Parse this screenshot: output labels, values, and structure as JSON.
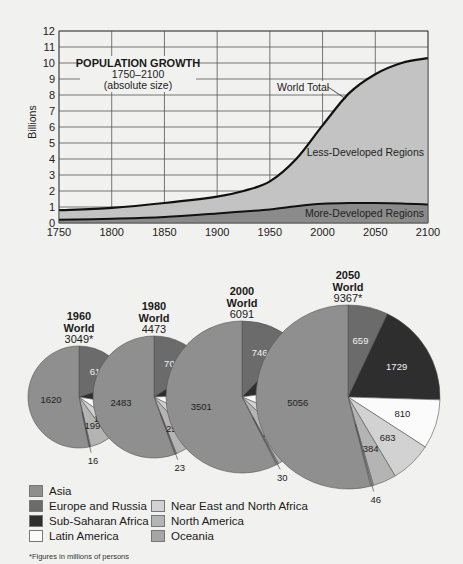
{
  "chart_data": [
    {
      "type": "area",
      "title": "POPULATION GROWTH",
      "subtitle": "1750–2100",
      "subtitle2": "(absolute size)",
      "xlabel": "",
      "ylabel": "Billions",
      "xlim": [
        1750,
        2100
      ],
      "ylim": [
        0,
        12
      ],
      "grid": true,
      "x_ticks": [
        "1750",
        "1800",
        "1850",
        "1900",
        "1950",
        "2000",
        "2050",
        "2100"
      ],
      "y_ticks": [
        "0",
        "1",
        "2",
        "3",
        "4",
        "5",
        "6",
        "7",
        "8",
        "9",
        "10",
        "11",
        "12"
      ],
      "x": [
        1750,
        1800,
        1850,
        1900,
        1925,
        1950,
        1975,
        2000,
        2025,
        2050,
        2075,
        2100
      ],
      "series": [
        {
          "name": "World Total",
          "values": [
            0.8,
            0.95,
            1.25,
            1.65,
            2.0,
            2.6,
            4.0,
            6.1,
            8.1,
            9.3,
            10.0,
            10.3
          ]
        },
        {
          "name": "More-Developed Regions",
          "values": [
            0.2,
            0.27,
            0.38,
            0.6,
            0.72,
            0.85,
            1.05,
            1.2,
            1.25,
            1.25,
            1.22,
            1.15
          ]
        }
      ],
      "annotations": [
        "World Total",
        "Less-Developed Regions",
        "More-Developed Regions"
      ]
    },
    {
      "type": "pie",
      "title": "World population by region",
      "note": "*Figures in millions of persons",
      "categories": [
        "Asia",
        "Europe and Russia",
        "Sub-Saharan Africa",
        "Latin America",
        "Near East and North Africa",
        "North America",
        "Oceania"
      ],
      "series": [
        {
          "name": "1960 World",
          "total": "3049*",
          "values": [
            1620,
            615,
            227,
            218,
            154,
            199,
            16
          ]
        },
        {
          "name": "1980 World",
          "total": "4473",
          "values": [
            2483,
            708,
            381,
            364,
            262,
            252,
            23
          ]
        },
        {
          "name": "2000 World",
          "total": "6091",
          "values": [
            3501,
            746,
            645,
            515,
            346,
            308,
            30
          ]
        },
        {
          "name": "2050 World",
          "total": "9367*",
          "values": [
            5056,
            659,
            1729,
            810,
            683,
            384,
            46
          ]
        }
      ]
    }
  ],
  "colors": {
    "Asia": "#8f8f8f",
    "Europe and Russia": "#6b6b6b",
    "Sub-Saharan Africa": "#2e2e2e",
    "Latin America": "#fbfbfb",
    "Near East and North Africa": "#d2d2d2",
    "North America": "#b4b4b4",
    "Oceania": "#a6a6a6",
    "less_developed": "#c3c3c3",
    "more_developed": "#8b8b8b"
  },
  "legend": {
    "items": [
      {
        "label": "Asia"
      },
      {
        "label": "Europe and Russia"
      },
      {
        "label": "Sub-Saharan Africa"
      },
      {
        "label": "Latin America"
      },
      {
        "label": "Near East and North Africa"
      },
      {
        "label": "North America"
      },
      {
        "label": "Oceania"
      }
    ]
  },
  "footnote": "*Figures in millions of persons"
}
